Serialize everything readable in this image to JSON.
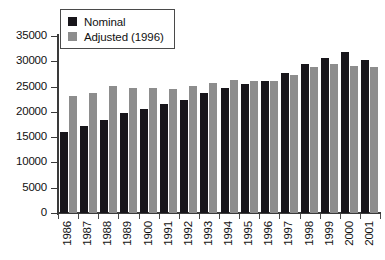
{
  "chart_data": {
    "type": "bar",
    "title": "",
    "subtitle": "",
    "xlabel": "",
    "ylabel": "",
    "ylim": [
      0,
      35000
    ],
    "ytick_values": [
      0,
      5000,
      10000,
      15000,
      20000,
      25000,
      30000,
      35000
    ],
    "ytick_labels": [
      "0",
      "5000",
      "10000",
      "15000",
      "20000",
      "25000",
      "30000",
      "35000"
    ],
    "grid": false,
    "legend_position": "top-left",
    "categories": [
      "1986",
      "1987",
      "1988",
      "1989",
      "1900",
      "1991",
      "1992",
      "1993",
      "1994",
      "1995",
      "1996",
      "1997",
      "1998",
      "1999",
      "2000",
      "2001"
    ],
    "series": [
      {
        "name": "Nominal",
        "color": "#17151a",
        "values": [
          16000,
          17300,
          18400,
          19700,
          20500,
          21500,
          22400,
          23700,
          24700,
          25600,
          26100,
          27700,
          29400,
          30600,
          31900,
          30200
        ]
      },
      {
        "name": "Adjusted (1996)",
        "color": "#8d8d8d",
        "values": [
          23200,
          23800,
          25100,
          24800,
          24700,
          24600,
          25200,
          25700,
          26400,
          26200,
          26100,
          27200,
          28800,
          29400,
          29000,
          28900
        ]
      }
    ]
  },
  "legend": {
    "items": [
      {
        "label": "Nominal",
        "swatch": "nominal-swatch"
      },
      {
        "label": "Adjusted (1996)",
        "swatch": "adjusted-swatch"
      }
    ]
  }
}
